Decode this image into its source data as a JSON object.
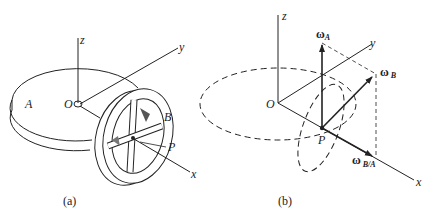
{
  "figure": {
    "panel_a": {
      "caption": "(a)",
      "labels": {
        "z": "z",
        "y": "y",
        "x": "x",
        "origin": "O",
        "disk": "A",
        "wheel": "B",
        "point": "P"
      }
    },
    "panel_b": {
      "caption": "(b)",
      "labels": {
        "z": "z",
        "y": "y",
        "x": "x",
        "origin": "O",
        "point": "P",
        "omega_a": "ω",
        "omega_a_sub": "A",
        "omega_b": "ω",
        "omega_b_sub": "B",
        "omega_ba": "ω",
        "omega_ba_sub": "B/A"
      }
    },
    "colors": {
      "ink": "#222222",
      "background": "#ffffff"
    }
  }
}
